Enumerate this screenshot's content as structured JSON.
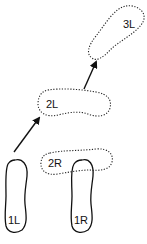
{
  "diagram": {
    "type": "footstep-sequence",
    "colors": {
      "stroke": "#111111",
      "background": "#ffffff"
    },
    "footprints": [
      {
        "id": "1L",
        "label": "1L",
        "style": "solid"
      },
      {
        "id": "1R",
        "label": "1R",
        "style": "solid"
      },
      {
        "id": "2R",
        "label": "2R",
        "style": "dotted"
      },
      {
        "id": "2L",
        "label": "2L",
        "style": "dotted"
      },
      {
        "id": "3L",
        "label": "3L",
        "style": "dotted"
      }
    ],
    "arrows": [
      {
        "from": "1L",
        "to": "2L"
      },
      {
        "from": "2L",
        "to": "3L"
      }
    ]
  }
}
